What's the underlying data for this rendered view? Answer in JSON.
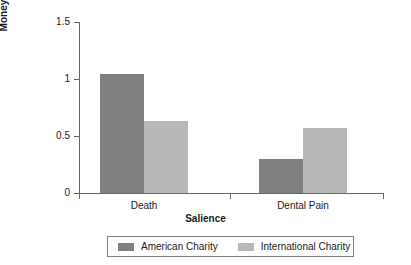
{
  "chart_data": {
    "type": "bar",
    "title": "",
    "xlabel": "Salience",
    "ylabel": "Money Donated in US Dollars",
    "ylabel_line1": "Money Donated in US",
    "ylabel_line2": "Dollars",
    "categories": [
      "Death",
      "Dental Pain"
    ],
    "series": [
      {
        "name": "American Charity",
        "color": "#808080",
        "values": [
          1.04,
          0.3
        ]
      },
      {
        "name": "International Charity",
        "color": "#b8b8b8",
        "values": [
          0.63,
          0.57
        ]
      }
    ],
    "ylim": [
      0,
      1.5
    ],
    "yticks": [
      0,
      0.5,
      1,
      1.5
    ],
    "ytick_labels": [
      "0",
      "0.5",
      "1",
      "1.5"
    ],
    "grid": false,
    "legend_position": "bottom"
  },
  "legend": {
    "entries": [
      {
        "label": "American Charity"
      },
      {
        "label": "International Charity"
      }
    ]
  }
}
